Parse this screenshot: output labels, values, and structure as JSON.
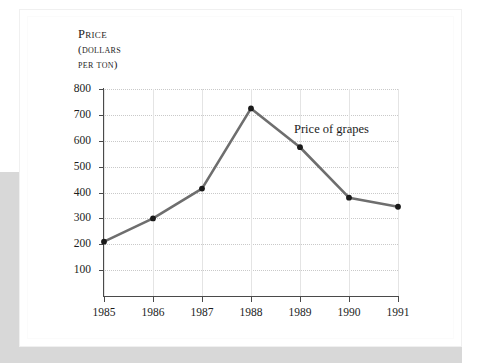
{
  "page": {
    "background_color": "#ffffff",
    "edge_shade_color": "#d8d8d8"
  },
  "chart_data": {
    "type": "line",
    "title": "",
    "xlabel": "",
    "ylabel": "PRICE (DOLLARS PER TON)",
    "ylabel_lines": [
      "Price",
      "(dollars",
      "per ton)"
    ],
    "categories": [
      "1985",
      "1986",
      "1987",
      "1988",
      "1989",
      "1990",
      "1991"
    ],
    "x": [
      1985,
      1986,
      1987,
      1988,
      1989,
      1990,
      1991
    ],
    "values": [
      210,
      300,
      415,
      725,
      575,
      380,
      345
    ],
    "series": [
      {
        "name": "Price of grapes",
        "values": [
          210,
          300,
          415,
          725,
          575,
          380,
          345
        ],
        "line_color": "#6e6e6e",
        "marker_color": "#1a1a1a"
      }
    ],
    "annotations": [
      {
        "text": "Price of grapes",
        "x": 1989,
        "y": 640
      }
    ],
    "ylim": [
      0,
      800
    ],
    "y_ticks": [
      100,
      200,
      300,
      400,
      500,
      600,
      700,
      800
    ],
    "y_tick_labels": [
      "100",
      "200",
      "300",
      "400",
      "500",
      "600",
      "700",
      "800"
    ],
    "x_tick_labels": [
      "1985",
      "1986",
      "1987",
      "1988",
      "1989",
      "1990",
      "1991"
    ],
    "grid": {
      "horizontal": true,
      "horizontal_style": "dotted",
      "horizontal_color": "#c9c9c9",
      "vertical": true,
      "vertical_style": "solid",
      "vertical_color": "#e4e4e4"
    },
    "legend": {
      "visible": false,
      "position": "none"
    },
    "axis_color": "#4a4a4a"
  }
}
